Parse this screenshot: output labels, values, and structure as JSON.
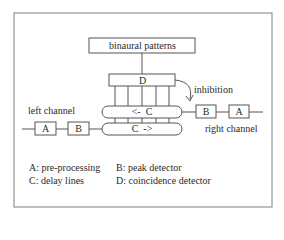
{
  "diagram": {
    "top_box": "binaural patterns",
    "coincidence_box": "D",
    "inhibition_label": "inhibition",
    "delay_line_top": "<-  C",
    "delay_line_bottom": "C  ->",
    "left_channel_label": "left channel",
    "right_channel_label": "right channel",
    "left_chain": [
      "A",
      "B"
    ],
    "right_chain": [
      "B",
      "A"
    ]
  },
  "legend": {
    "items": [
      "A: pre-processing",
      "B: peak detector",
      "C: delay lines",
      "D: coincidence detector"
    ]
  },
  "colors": {
    "line": "#555555",
    "frame": "#777777",
    "text": "#2a2a2a"
  }
}
